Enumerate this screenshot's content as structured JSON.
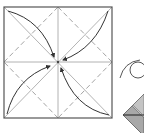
{
  "diagram": {
    "type": "origami-instruction",
    "colors": {
      "background": "#ffffff",
      "outline": "#555555",
      "crease": "#9a9a9a",
      "arrow": "#333333",
      "paper_shade": "#a8a8a8",
      "paper_shade_light": "#c4c4c4"
    },
    "square": {
      "x": 4,
      "y": 7,
      "size": 108
    },
    "center": {
      "x": 58,
      "y": 62
    },
    "arrows": [
      {
        "from": "top-left-corner",
        "to": "center"
      },
      {
        "from": "top-right-corner",
        "to": "center"
      },
      {
        "from": "bottom-left-corner",
        "to": "center"
      },
      {
        "from": "bottom-right-corner",
        "to": "center"
      }
    ],
    "symbols": [
      "turn-over-loop-arrow"
    ],
    "next_step": "folded square (rotated diamond) partially visible at right edge"
  }
}
